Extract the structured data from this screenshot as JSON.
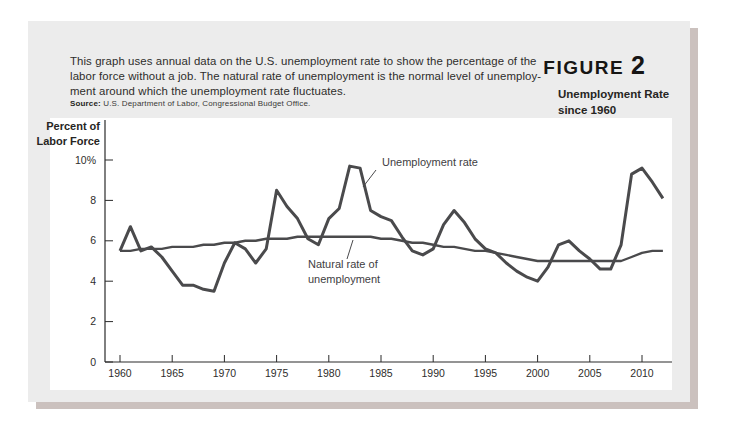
{
  "figure": {
    "label": "FIGURE",
    "number": "2",
    "title_line1": "Unemployment Rate",
    "title_line2": "since 1960"
  },
  "description_lines": [
    "This graph uses annual data on the U.S. unemployment rate to show the percentage of the",
    "labor force without a job. The natural rate of unemployment is the normal level of unemploy-",
    "ment around which the unemployment rate fluctuates."
  ],
  "source": {
    "label": "Source:",
    "text": "U.S. Department of Labor, Congressional Budget Office."
  },
  "colors": {
    "panel_bg": "#ececec",
    "chart_bg": "#ffffff",
    "line": "#4a4a4c",
    "shadow": "#cbc1be"
  },
  "chart_data": {
    "type": "line",
    "title": "Unemployment Rate since 1960",
    "ylabel_lines": [
      "Percent of",
      "Labor Force"
    ],
    "ylim": [
      0,
      10
    ],
    "yticks": [
      0,
      2,
      4,
      6,
      8,
      10
    ],
    "ytick_labels": [
      "0",
      "2",
      "4",
      "6",
      "8",
      "10%"
    ],
    "xlim": [
      1960,
      2012
    ],
    "xticks": [
      1960,
      1965,
      1970,
      1975,
      1980,
      1985,
      1990,
      1995,
      2000,
      2005,
      2010
    ],
    "grid": false,
    "line_color": "#4a4a4c",
    "x": [
      1960,
      1961,
      1962,
      1963,
      1964,
      1965,
      1966,
      1967,
      1968,
      1969,
      1970,
      1971,
      1972,
      1973,
      1974,
      1975,
      1976,
      1977,
      1978,
      1979,
      1980,
      1981,
      1982,
      1983,
      1984,
      1985,
      1986,
      1987,
      1988,
      1989,
      1990,
      1991,
      1992,
      1993,
      1994,
      1995,
      1996,
      1997,
      1998,
      1999,
      2000,
      2001,
      2002,
      2003,
      2004,
      2005,
      2006,
      2007,
      2008,
      2009,
      2010,
      2011,
      2012
    ],
    "series": [
      {
        "name": "Unemployment rate",
        "values": [
          5.5,
          6.7,
          5.5,
          5.7,
          5.2,
          4.5,
          3.8,
          3.8,
          3.6,
          3.5,
          4.9,
          5.9,
          5.6,
          4.9,
          5.6,
          8.5,
          7.7,
          7.1,
          6.1,
          5.8,
          7.1,
          7.6,
          9.7,
          9.6,
          7.5,
          7.2,
          7.0,
          6.2,
          5.5,
          5.3,
          5.6,
          6.8,
          7.5,
          6.9,
          6.1,
          5.6,
          5.4,
          4.9,
          4.5,
          4.2,
          4.0,
          4.7,
          5.8,
          6.0,
          5.5,
          5.1,
          4.6,
          4.6,
          5.8,
          9.3,
          9.6,
          8.9,
          8.1
        ]
      },
      {
        "name": "Natural rate of unemployment",
        "values": [
          5.5,
          5.5,
          5.6,
          5.6,
          5.6,
          5.7,
          5.7,
          5.7,
          5.8,
          5.8,
          5.9,
          5.9,
          6.0,
          6.0,
          6.1,
          6.1,
          6.1,
          6.2,
          6.2,
          6.2,
          6.2,
          6.2,
          6.2,
          6.2,
          6.2,
          6.1,
          6.1,
          6.0,
          5.9,
          5.9,
          5.8,
          5.7,
          5.7,
          5.6,
          5.5,
          5.5,
          5.4,
          5.3,
          5.2,
          5.1,
          5.0,
          5.0,
          5.0,
          5.0,
          5.0,
          5.0,
          5.0,
          5.0,
          5.0,
          5.2,
          5.4,
          5.5,
          5.5
        ]
      }
    ],
    "annotations": [
      {
        "text_lines": [
          "Unemployment rate"
        ]
      },
      {
        "text_lines": [
          "Natural rate of",
          "unemployment"
        ]
      }
    ]
  }
}
